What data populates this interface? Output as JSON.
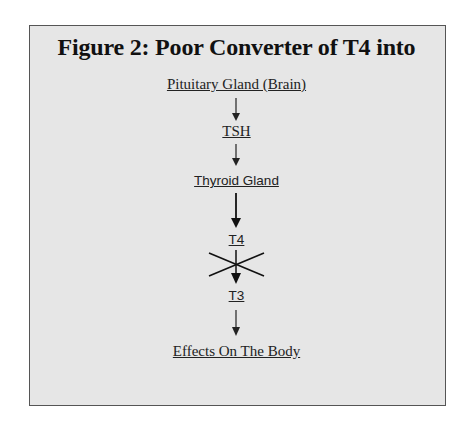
{
  "figure": {
    "title": "Figure 2:  Poor Converter of T4 into",
    "nodes": [
      {
        "id": "pituitary",
        "label": "Pituitary Gland (Brain)"
      },
      {
        "id": "tsh",
        "label": "TSH"
      },
      {
        "id": "thyroid",
        "label": "Thyroid Gland"
      },
      {
        "id": "t4",
        "label": "T4"
      },
      {
        "id": "t3",
        "label": "T3"
      },
      {
        "id": "effects",
        "label": "Effects On The Body"
      }
    ],
    "edges": [
      {
        "from": "pituitary",
        "to": "tsh",
        "blocked": false
      },
      {
        "from": "tsh",
        "to": "thyroid",
        "blocked": false
      },
      {
        "from": "thyroid",
        "to": "t4",
        "blocked": false
      },
      {
        "from": "t4",
        "to": "t3",
        "blocked": true
      },
      {
        "from": "t3",
        "to": "effects",
        "blocked": false
      }
    ],
    "colors": {
      "background": "#e6e6e6",
      "border": "#555555",
      "text": "#111111"
    }
  }
}
